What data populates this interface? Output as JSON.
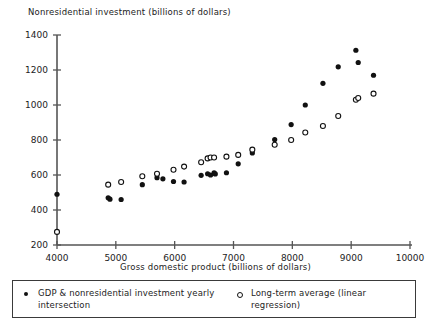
{
  "chart_data": {
    "type": "scatter",
    "title": "",
    "xlabel": "Gross domestic product (billions of dollars)",
    "ylabel": "Nonresidential investment (billions of dollars)",
    "xlim": [
      4000,
      10000
    ],
    "ylim": [
      200,
      1400
    ],
    "xticks": [
      4000,
      5000,
      6000,
      7000,
      8000,
      9000,
      10000
    ],
    "yticks": [
      200,
      400,
      600,
      800,
      1000,
      1200,
      1400
    ],
    "grid": false,
    "legend_position": "bottom",
    "series": [
      {
        "name": "GDP & nonresidential investment yearly intersection",
        "marker": "filled-circle",
        "color": "#111111",
        "points": [
          [
            4000,
            490
          ],
          [
            4870,
            470
          ],
          [
            4900,
            462
          ],
          [
            5090,
            460
          ],
          [
            5450,
            545
          ],
          [
            5700,
            585
          ],
          [
            5800,
            578
          ],
          [
            5980,
            563
          ],
          [
            6160,
            560
          ],
          [
            6450,
            598
          ],
          [
            6560,
            607
          ],
          [
            6610,
            600
          ],
          [
            6670,
            612
          ],
          [
            6690,
            606
          ],
          [
            6880,
            613
          ],
          [
            7080,
            664
          ],
          [
            7320,
            726
          ],
          [
            7700,
            803
          ],
          [
            7980,
            888
          ],
          [
            8220,
            1000
          ],
          [
            8520,
            1124
          ],
          [
            8780,
            1218
          ],
          [
            9080,
            1313
          ],
          [
            9120,
            1243
          ],
          [
            9380,
            1170
          ]
        ]
      },
      {
        "name": "Long-term average (linear regression)",
        "marker": "open-circle",
        "color": "#111111",
        "points": [
          [
            4000,
            275
          ],
          [
            4870,
            545
          ],
          [
            5090,
            560
          ],
          [
            5450,
            593
          ],
          [
            5700,
            607
          ],
          [
            5980,
            630
          ],
          [
            6160,
            648
          ],
          [
            6450,
            673
          ],
          [
            6560,
            695
          ],
          [
            6610,
            700
          ],
          [
            6670,
            700
          ],
          [
            6880,
            705
          ],
          [
            7080,
            715
          ],
          [
            7320,
            745
          ],
          [
            7700,
            773
          ],
          [
            7980,
            800
          ],
          [
            8220,
            843
          ],
          [
            8520,
            880
          ],
          [
            8780,
            937
          ],
          [
            9080,
            1030
          ],
          [
            9120,
            1040
          ],
          [
            9380,
            1065
          ]
        ]
      }
    ]
  },
  "legend": {
    "entries": [
      {
        "marker": "filled-circle-marker",
        "label": "GDP & nonresidential investment yearly intersection"
      },
      {
        "marker": "open-circle-marker",
        "label": "Long-term average (linear regression)"
      }
    ]
  },
  "colors": {
    "axis": "#555555",
    "marker": "#111111",
    "text": "#232323",
    "legend_border": "#3a3a3a",
    "background": "#ffffff"
  }
}
